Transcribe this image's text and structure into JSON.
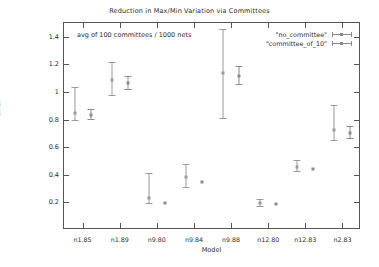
{
  "chart_data": {
    "type": "scatter",
    "title": "Reduction in Max/Min Variation via Committees",
    "annotation": "avg of 100 committees / 1000 nets",
    "xlabel": "Model",
    "ylabel": "Error",
    "categories": [
      "n1.85",
      "n1.89",
      "n9.80",
      "n9.84",
      "n9.88",
      "n12.80",
      "n12.83",
      "n2.83"
    ],
    "ylim": [
      0,
      1.5
    ],
    "yticks": [
      0.2,
      0.4,
      0.6,
      0.8,
      1.0,
      1.2,
      1.4
    ],
    "ytick_labels": [
      "0.2",
      "0.4",
      "0.6",
      "0.8",
      "1",
      "1.2",
      "1.4"
    ],
    "grid": false,
    "legend_position": "top-right",
    "series": [
      {
        "name": "\"no_committee\"",
        "marker": "point-with-errorbars",
        "values": [
          0.845,
          1.085,
          0.235,
          0.385,
          1.135,
          0.195,
          0.455,
          0.725
        ],
        "err_low": [
          0.795,
          0.975,
          0.195,
          0.315,
          0.815,
          0.175,
          0.425,
          0.655
        ],
        "err_high": [
          1.035,
          1.215,
          0.415,
          0.475,
          1.455,
          0.225,
          0.505,
          0.905
        ]
      },
      {
        "name": "\"committee_of_10\"",
        "marker": "point-with-errorbars",
        "values": [
          0.835,
          1.065,
          0.195,
          0.345,
          1.115,
          0.185,
          0.445,
          0.705
        ],
        "err_low": [
          0.805,
          1.025,
          0.195,
          0.345,
          1.055,
          0.185,
          0.445,
          0.665
        ],
        "err_high": [
          0.875,
          1.115,
          0.195,
          0.345,
          1.185,
          0.185,
          0.445,
          0.755
        ]
      }
    ]
  },
  "colors": {
    "axis": "#555555",
    "text": "#2b2b2b",
    "series1": "#9a9a9a",
    "series2": "#8c8c8c",
    "background": "#ffffff"
  }
}
